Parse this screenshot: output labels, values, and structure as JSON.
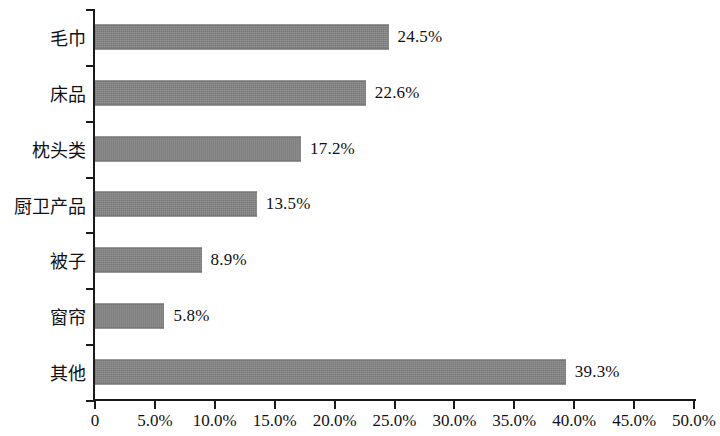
{
  "chart_data": {
    "type": "bar",
    "orientation": "horizontal",
    "title": "",
    "subtitle": "",
    "xlabel": "",
    "ylabel": "",
    "categories": [
      "毛巾",
      "床品",
      "枕头类",
      "厨卫产品",
      "被子",
      "窗帘",
      "其他"
    ],
    "values": [
      24.5,
      22.6,
      17.2,
      13.5,
      8.9,
      5.8,
      39.3
    ],
    "value_labels": [
      "24.5%",
      "22.6%",
      "17.2%",
      "13.5%",
      "8.9%",
      "5.8%",
      "39.3%"
    ],
    "xlim": [
      0,
      50
    ],
    "x_tick_values": [
      0,
      5,
      10,
      15,
      20,
      25,
      30,
      35,
      40,
      45,
      50
    ],
    "x_tick_labels": [
      "0",
      "5.0%",
      "10.0%",
      "15.0%",
      "20.0%",
      "25.0%",
      "30.0%",
      "35.0%",
      "40.0%",
      "45.0%",
      "50.0%"
    ],
    "grid": false,
    "legend": false,
    "legend_position": "none",
    "bar_color": "#808080",
    "axis_color": "#1a1a1a",
    "text_color": "#111111",
    "background_color": "#ffffff"
  }
}
